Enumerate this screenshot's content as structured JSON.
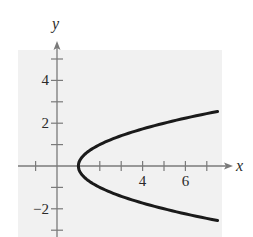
{
  "chart_data": {
    "type": "line",
    "title": "",
    "equation": "x = y^2 + 1",
    "xlabel": "x",
    "ylabel": "y",
    "xlim": [
      -1.8,
      8.2
    ],
    "ylim": [
      -3.4,
      5.5
    ],
    "x_ticks": [
      -1,
      1,
      2,
      3,
      4,
      5,
      6,
      7
    ],
    "x_tick_labels": [
      {
        "value": 4,
        "label": "4"
      },
      {
        "value": 6,
        "label": "6"
      }
    ],
    "y_ticks": [
      -3,
      -2,
      -1,
      1,
      2,
      3,
      4,
      5
    ],
    "y_tick_labels": [
      {
        "value": 4,
        "label": "4"
      },
      {
        "value": 2,
        "label": "2"
      },
      {
        "value": -2,
        "label": "−2"
      }
    ],
    "grid": false,
    "series": [
      {
        "name": "parabola",
        "points": [
          {
            "x": 7.25,
            "y": 2.5
          },
          {
            "x": 5.0,
            "y": 2.0
          },
          {
            "x": 3.25,
            "y": 1.5
          },
          {
            "x": 2.0,
            "y": 1.0
          },
          {
            "x": 1.25,
            "y": 0.5
          },
          {
            "x": 1.0,
            "y": 0.0
          },
          {
            "x": 1.25,
            "y": -0.5
          },
          {
            "x": 2.0,
            "y": -1.0
          },
          {
            "x": 3.25,
            "y": -1.5
          },
          {
            "x": 5.0,
            "y": -2.0
          },
          {
            "x": 7.25,
            "y": -2.5
          }
        ]
      }
    ]
  },
  "colors": {
    "background_panel": "#f1f1f1",
    "axis": "#7a7a7a",
    "curve": "#1a1a1a",
    "text": "#2a2a2a"
  }
}
